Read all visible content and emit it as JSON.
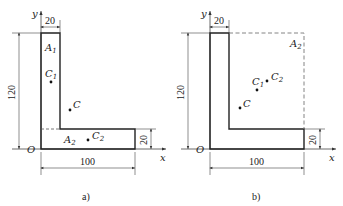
{
  "figures": [
    {
      "id": "a",
      "caption": "a)",
      "axis_x": "x",
      "axis_y": "y",
      "origin": "O",
      "dims": {
        "top_width": "20",
        "height": "120",
        "bottom_width": "100",
        "flange_thickness": "20"
      },
      "regions": [
        {
          "name": "A",
          "sub": "1"
        },
        {
          "name": "A",
          "sub": "2"
        }
      ],
      "points": [
        {
          "name": "C",
          "sub": "1"
        },
        {
          "name": "C",
          "sub": ""
        },
        {
          "name": "C",
          "sub": "2"
        }
      ]
    },
    {
      "id": "b",
      "caption": "b)",
      "axis_x": "x",
      "axis_y": "y",
      "origin": "O",
      "dims": {
        "top_width": "20",
        "height": "120",
        "bottom_width": "100",
        "flange_thickness": "20"
      },
      "regions": [
        {
          "name": "A",
          "sub": "2"
        }
      ],
      "points": [
        {
          "name": "C",
          "sub": "1"
        },
        {
          "name": "C",
          "sub": "2"
        },
        {
          "name": "C",
          "sub": ""
        }
      ]
    }
  ]
}
